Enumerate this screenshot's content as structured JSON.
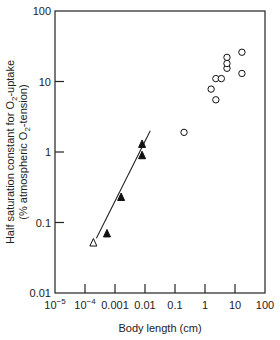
{
  "chart_data": {
    "type": "scatter",
    "title": "",
    "xlabel": "Body length (cm)",
    "ylabel_line1": "Half saturation constant for O2-uptake",
    "ylabel_line2": "(% atmospheric O2-tension)",
    "xscale": "log",
    "yscale": "log",
    "xlim": [
      1e-05,
      100
    ],
    "ylim": [
      0.01,
      100
    ],
    "x_ticks": [
      {
        "value": 1e-05,
        "label": "10",
        "sup": "−5"
      },
      {
        "value": 0.0001,
        "label": "10",
        "sup": "−4"
      },
      {
        "value": 0.001,
        "label": "0.001",
        "sup": ""
      },
      {
        "value": 0.01,
        "label": "0.01",
        "sup": ""
      },
      {
        "value": 0.1,
        "label": "0.1",
        "sup": ""
      },
      {
        "value": 1,
        "label": "1",
        "sup": ""
      },
      {
        "value": 10,
        "label": "10",
        "sup": ""
      },
      {
        "value": 100,
        "label": "100",
        "sup": ""
      }
    ],
    "y_ticks": [
      {
        "value": 0.01,
        "label": "0.01"
      },
      {
        "value": 0.1,
        "label": "0.1"
      },
      {
        "value": 1,
        "label": "1"
      },
      {
        "value": 10,
        "label": "10"
      },
      {
        "value": 100,
        "label": "100"
      }
    ],
    "grid": false,
    "legend": null,
    "series": [
      {
        "name": "open triangle",
        "marker": "triangle-open",
        "points": [
          {
            "x": 0.00019,
            "y": 0.052
          }
        ]
      },
      {
        "name": "filled triangles",
        "marker": "triangle-filled",
        "points": [
          {
            "x": 0.00054,
            "y": 0.07
          },
          {
            "x": 0.0016,
            "y": 0.23
          },
          {
            "x": 0.008,
            "y": 0.9
          },
          {
            "x": 0.008,
            "y": 1.3
          }
        ]
      },
      {
        "name": "open circles",
        "marker": "circle-open",
        "points": [
          {
            "x": 0.2,
            "y": 1.9
          },
          {
            "x": 1.6,
            "y": 7.8
          },
          {
            "x": 2.3,
            "y": 5.5
          },
          {
            "x": 2.3,
            "y": 11
          },
          {
            "x": 3.5,
            "y": 11
          },
          {
            "x": 5.4,
            "y": 15.4
          },
          {
            "x": 5.4,
            "y": 18
          },
          {
            "x": 5.4,
            "y": 22
          },
          {
            "x": 17,
            "y": 13
          },
          {
            "x": 17,
            "y": 26
          }
        ]
      }
    ],
    "fit_line": {
      "name": "regression line",
      "from": {
        "x": 0.00024,
        "y": 0.06
      },
      "to": {
        "x": 0.015,
        "y": 2.0
      }
    }
  },
  "style": {
    "axis_color": "#222222",
    "marker_color": "#111111"
  }
}
